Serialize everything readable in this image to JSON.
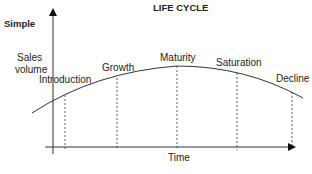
{
  "title": "LIFE CYCLE",
  "side_label": "Simple",
  "y_axis_label_line1": "Sales",
  "y_axis_label_line2": "volume",
  "x_axis_label": "Time",
  "stages": [
    {
      "label": "Introduction"
    },
    {
      "label": "Growth"
    },
    {
      "label": "Maturity"
    },
    {
      "label": "Saturation"
    },
    {
      "label": "Decline"
    }
  ],
  "colors": {
    "line": "#333333",
    "axis": "#222222"
  }
}
